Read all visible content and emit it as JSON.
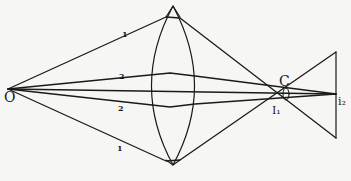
{
  "diagram": {
    "labels": {
      "object_point": "O",
      "ray_upper_marginal": "1",
      "ray_lower_marginal": "1",
      "ray_upper_paraxial": "2",
      "ray_lower_paraxial": "2",
      "circle_of_least_confusion": "C",
      "marginal_focus": "I₁",
      "paraxial_focus": "i₂"
    },
    "colors": {
      "ink": "#1a1a1a",
      "paper": "#f6f6f4"
    },
    "points": {
      "O": [
        8,
        89
      ],
      "lens_top": [
        173,
        6
      ],
      "lens_bottom": [
        173,
        165
      ],
      "ray1_top_at_lens": [
        166,
        17
      ],
      "ray1_bottom_at_lens": [
        166,
        161
      ],
      "ray2_top_at_lens": [
        170,
        73
      ],
      "ray2_bottom_at_lens": [
        170,
        106
      ],
      "I1": [
        277,
        93
      ],
      "C": [
        285,
        94
      ],
      "i2": [
        336,
        94
      ],
      "image_top": [
        336,
        52
      ],
      "image_bottom": [
        336,
        138
      ]
    }
  }
}
